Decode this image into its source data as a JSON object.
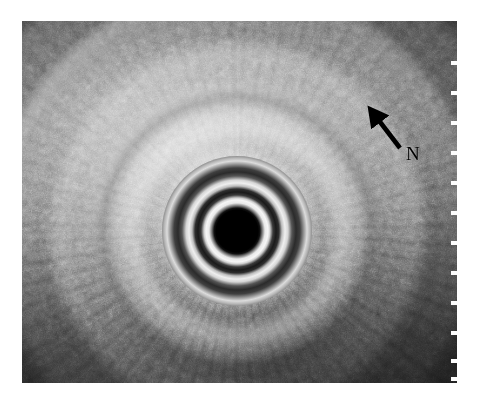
{
  "figure": {
    "modality": "endoscopic-ultrasound",
    "background_color": "#ffffff",
    "scan_frame": {
      "left": 22,
      "top": 21,
      "width": 435,
      "height": 362,
      "border_color": "#0a0a0a"
    }
  },
  "scan": {
    "transducer": {
      "name": "catheter-transducer-artifact",
      "center_x_pct": 49.5,
      "center_y_pct": 58,
      "core_color": "#000000",
      "ring_bright_color": "#f6f6f6",
      "ring_dark_color": "#1a1a1a",
      "ring_count": 5
    },
    "tissue": {
      "bright_region": "upper-left",
      "dark_region": "lower-right",
      "texture": "speckle"
    }
  },
  "annotations": [
    {
      "name": "lesion-pointer",
      "type": "arrow",
      "label": "N",
      "color": "#000000",
      "tail_x": 378,
      "tail_y": 127,
      "head_x": 351,
      "head_y": 92,
      "label_x": 384,
      "label_y": 123
    }
  ],
  "depth_ruler": {
    "name": "depth-scale",
    "tick_color": "#fdfdfd",
    "tick_count": 12,
    "tick_positions_px": [
      40,
      70,
      100,
      130,
      160,
      190,
      220,
      250,
      280,
      310,
      338,
      356
    ]
  }
}
